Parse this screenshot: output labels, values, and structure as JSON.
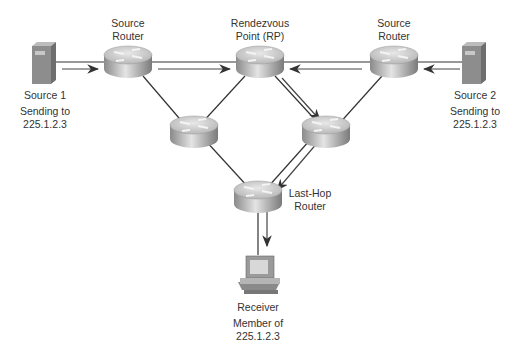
{
  "nodes": {
    "source1": {
      "name": "Source 1",
      "line1": "Sending to",
      "line2": "225.1.2.3"
    },
    "source2": {
      "name": "Source 2",
      "line1": "Sending to",
      "line2": "225.1.2.3"
    },
    "source_router_left": {
      "line1": "Source",
      "line2": "Router"
    },
    "rp": {
      "line1": "Rendezvous",
      "line2": "Point (RP)"
    },
    "source_router_right": {
      "line1": "Source",
      "line2": "Router"
    },
    "last_hop": {
      "line1": "Last-Hop",
      "line2": "Router"
    },
    "receiver": {
      "name": "Receiver",
      "line1": "Member of",
      "line2": "225.1.2.3"
    }
  },
  "colors": {
    "line": "#333333",
    "arrow": "#555555",
    "router_top": "#d8d8d8",
    "router_side": "#a8a8a8"
  }
}
